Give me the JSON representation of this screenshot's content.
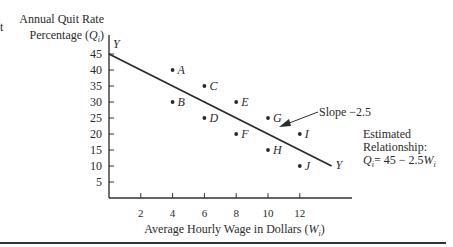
{
  "chart_data": {
    "type": "scatter",
    "title": "",
    "ylabel_line1": "Annual Quit Rate",
    "ylabel_line2": "Percentage (Qi)",
    "xlabel": "Average Hourly Wage in Dollars (Wi)",
    "x_ticks": [
      2,
      4,
      6,
      8,
      10,
      12
    ],
    "y_ticks": [
      5,
      10,
      15,
      20,
      25,
      30,
      35,
      40,
      45
    ],
    "xlim": [
      0,
      15
    ],
    "ylim": [
      0,
      50
    ],
    "grid": false,
    "points": [
      {
        "label": "A",
        "x": 4,
        "y": 40
      },
      {
        "label": "B",
        "x": 4,
        "y": 30
      },
      {
        "label": "C",
        "x": 6,
        "y": 35
      },
      {
        "label": "D",
        "x": 6,
        "y": 25
      },
      {
        "label": "E",
        "x": 8,
        "y": 30
      },
      {
        "label": "F",
        "x": 8,
        "y": 20
      },
      {
        "label": "G",
        "x": 10,
        "y": 25
      },
      {
        "label": "H",
        "x": 10,
        "y": 15
      },
      {
        "label": "I",
        "x": 12,
        "y": 20
      },
      {
        "label": "J",
        "x": 12,
        "y": 10
      }
    ],
    "line": {
      "intercept": 45,
      "slope": -2.5,
      "x_start": 0,
      "x_end": 14,
      "end_label": "Y",
      "start_label": "Y"
    },
    "annotations": {
      "slope_label": "Slope −2.5",
      "relationship_line1": "Estimated",
      "relationship_line2": "Relationship:",
      "relationship_line3": "Qi = 45 − 2.5Wi"
    }
  },
  "labels": {
    "left_fragment": "t",
    "ylabel_line1": "Annual Quit Rate",
    "ylabel_pre": "Percentage (",
    "ylabel_var": "Q",
    "ylabel_sub": "i",
    "ylabel_post": ")",
    "xlabel_pre": "Average Hourly Wage in Dollars (",
    "xlabel_var": "W",
    "xlabel_sub": "i",
    "xlabel_post": ")",
    "slope": "Slope −2.5",
    "rel1": "Estimated",
    "rel2": "Relationship:",
    "rel3_q": "Q",
    "rel3_sub": "i",
    "rel3_mid": "= 45 − 2.5",
    "rel3_w": "W",
    "rel3_wsub": "i"
  }
}
